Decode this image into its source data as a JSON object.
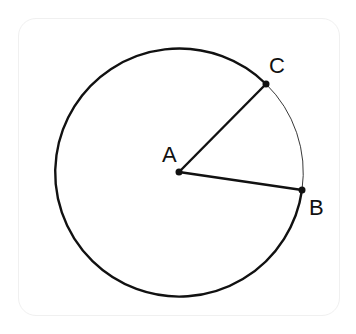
{
  "diagram": {
    "title": "",
    "circle": {
      "center": "A",
      "cx": 179,
      "cy": 172,
      "r": 124
    },
    "points": [
      {
        "label": "A",
        "x": 179,
        "y": 172
      },
      {
        "label": "B",
        "x": 302,
        "y": 190
      },
      {
        "label": "C",
        "x": 266,
        "y": 84
      }
    ],
    "segments": [
      {
        "from": "A",
        "to": "B"
      },
      {
        "from": "A",
        "to": "C"
      }
    ],
    "arcs": [
      {
        "from": "B",
        "to": "C",
        "style": "thin",
        "description": "minor arc BC"
      },
      {
        "from": "C",
        "to": "B",
        "style": "thick",
        "description": "major arc CB"
      }
    ],
    "colors": {
      "stroke": "#111111",
      "frame": "#f0f0f0"
    }
  }
}
